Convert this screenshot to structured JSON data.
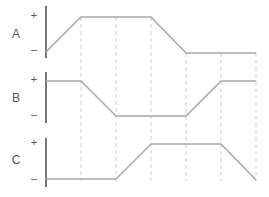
{
  "diagram": {
    "type": "timing-diagram",
    "colors": {
      "axis": "#555555",
      "signal": "#a8a8a8",
      "grid": "#cfcfcf",
      "text": "#555555"
    },
    "time_markers_x": [
      81,
      116,
      151,
      186,
      221,
      256
    ],
    "signals": [
      {
        "name": "A",
        "plus_label": "+",
        "minus_label": "–",
        "axis": {
          "x": 46,
          "y1": 6,
          "y2": 58
        },
        "name_pos": [
          16,
          38
        ],
        "plus_pos": [
          34,
          19
        ],
        "minus_pos": [
          34,
          53
        ],
        "points": [
          [
            46,
            52
          ],
          [
            81,
            17
          ],
          [
            151,
            17
          ],
          [
            186,
            53
          ],
          [
            256,
            53
          ]
        ]
      },
      {
        "name": "B",
        "plus_label": "+",
        "minus_label": "–",
        "axis": {
          "x": 46,
          "y1": 72,
          "y2": 123
        },
        "name_pos": [
          16,
          102
        ],
        "plus_pos": [
          34,
          83
        ],
        "minus_pos": [
          34,
          118
        ],
        "points": [
          [
            46,
            81
          ],
          [
            81,
            81
          ],
          [
            116,
            116
          ],
          [
            186,
            116
          ],
          [
            221,
            81
          ],
          [
            256,
            81
          ]
        ]
      },
      {
        "name": "C",
        "plus_label": "+",
        "minus_label": "–",
        "axis": {
          "x": 46,
          "y1": 138,
          "y2": 187
        },
        "name_pos": [
          16,
          164
        ],
        "plus_pos": [
          34,
          146
        ],
        "minus_pos": [
          34,
          182
        ],
        "points": [
          [
            46,
            179
          ],
          [
            116,
            179
          ],
          [
            151,
            144
          ],
          [
            221,
            144
          ],
          [
            256,
            180
          ]
        ]
      }
    ],
    "grid_lines": [
      {
        "x": 81,
        "y1": 17,
        "y2": 181
      },
      {
        "x": 116,
        "y1": 17,
        "y2": 181
      },
      {
        "x": 151,
        "y1": 17,
        "y2": 181
      },
      {
        "x": 186,
        "y1": 53,
        "y2": 181
      },
      {
        "x": 221,
        "y1": 53,
        "y2": 181
      },
      {
        "x": 256,
        "y1": 53,
        "y2": 181
      }
    ]
  }
}
